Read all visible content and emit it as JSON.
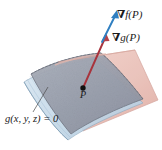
{
  "figure": {
    "background_color": "#ffffff",
    "width": 162,
    "height": 150
  },
  "labels": {
    "gradient_f": {
      "nabla": "∇",
      "text": "f(P)",
      "full": "∇f(P)",
      "color": "#1a1a1a"
    },
    "gradient_g": {
      "nabla": "∇",
      "text": "g(P)",
      "full": "∇g(P)",
      "color": "#1a1a1a"
    },
    "point": {
      "text": "P",
      "color": "#1a1a1a"
    },
    "constraint": {
      "text": "g(x, y, z) = 0",
      "color": "#1a1a1a"
    }
  },
  "vectors": [
    {
      "name": "gradient-f-vector",
      "label": "∇f(P)",
      "color": "#2f7fc1",
      "from": [
        104,
        40
      ],
      "to": [
        117,
        11
      ]
    },
    {
      "name": "gradient-g-vector",
      "label": "∇g(P)",
      "color": "#a8333c",
      "from": [
        83,
        88
      ],
      "to": [
        106,
        36
      ]
    }
  ],
  "surfaces": [
    {
      "name": "tangent-plane",
      "fill": "#e9bdb5",
      "stroke": "#c98f86",
      "opacity": 0.85
    },
    {
      "name": "constraint-surface",
      "fill": "#c6d9e8",
      "stroke": "#8aa8bd",
      "opacity": 0.9
    },
    {
      "name": "surface-patch",
      "fill": "#9ba0ad",
      "stroke": "#6a6f7c",
      "opacity": 0.95
    }
  ],
  "colors": {
    "gradient_f_arrow": "#2f7fc1",
    "gradient_g_arrow": "#a8333c",
    "plane_pink": "#e9bdb5",
    "surface_blue": "#c6d9e8",
    "patch_gray": "#9ba0ad",
    "point_dot": "#101010",
    "leader_line": "#4a4a4a"
  },
  "point_marker": {
    "name": "point-p-dot",
    "cx": 83,
    "cy": 88,
    "r": 2.6
  },
  "leader_line": {
    "name": "constraint-leader-line",
    "from": [
      33,
      112
    ],
    "to": [
      47,
      88
    ]
  }
}
